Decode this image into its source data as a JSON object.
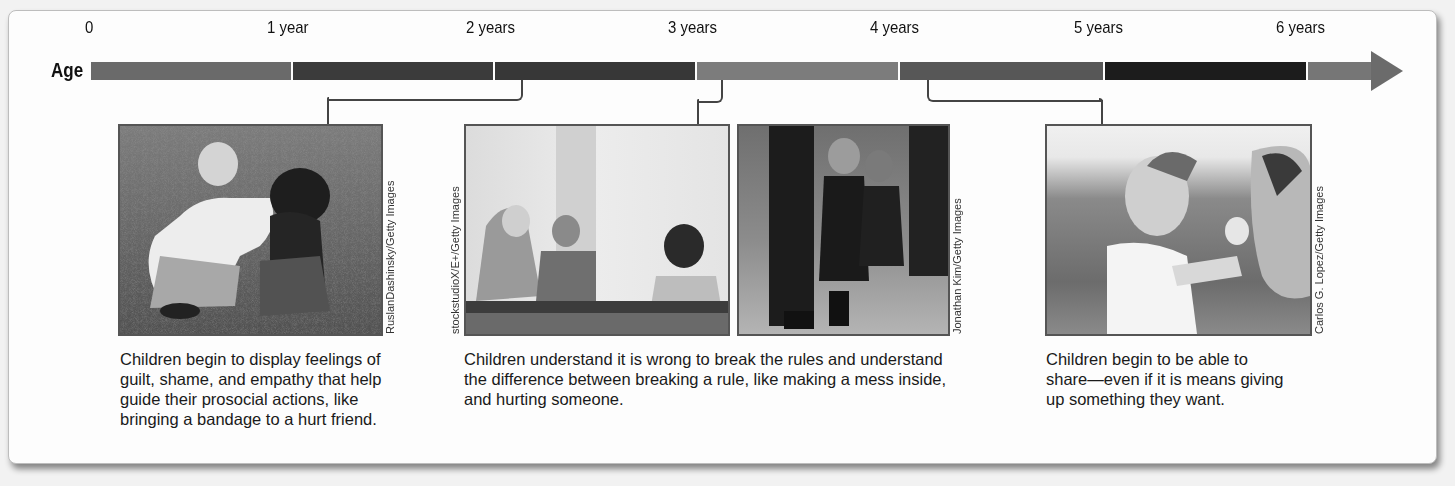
{
  "timeline": {
    "axis_label": "Age",
    "ticks": [
      "0",
      "1 year",
      "2 years",
      "3 years",
      "4 years",
      "5 years",
      "6 years"
    ],
    "segment_colors": [
      "#6a6a6a",
      "#3b3b3b",
      "#3a3a3a",
      "#7c7c7c",
      "#555555",
      "#1c1c1c",
      "#7a7a7a"
    ]
  },
  "milestones": [
    {
      "photo_alt": "Young boy comforting a crying child sitting on grass",
      "credit": "RuslanDashinsky/Getty Images",
      "caption_lines": [
        "Children begin to display feelings of",
        "guilt, shame, and empathy that help",
        "guide their prosocial actions, like",
        "bringing a bandage to a hurt friend."
      ]
    },
    {
      "photos": [
        {
          "alt": "Woman in hijab with two children playing at a table",
          "credit": "stockstudioX/E+/Getty Images"
        },
        {
          "alt": "Small children in dark dresses standing in a line",
          "credit": "Jonathan Kim/Getty Images"
        }
      ],
      "caption_lines": [
        "Children understand it is wrong to break the rules and understand",
        "the difference between breaking a rule, like making a mess inside,",
        "and hurting someone."
      ]
    },
    {
      "photo_alt": "Little girl offering an ice cream cone to an adult",
      "credit": "Carlos G. Lopez/Getty Images",
      "caption_lines": [
        "Children begin to be able to",
        "share—even if it is means giving",
        "up something they want."
      ]
    }
  ]
}
